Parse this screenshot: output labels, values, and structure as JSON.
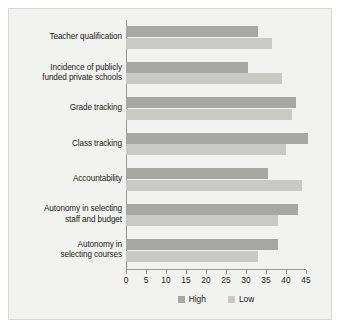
{
  "chart_data": {
    "type": "bar",
    "orientation": "horizontal",
    "title": "",
    "xlabel": "",
    "ylabel": "",
    "xlim": [
      0,
      45
    ],
    "xticks": [
      0,
      5,
      10,
      15,
      20,
      25,
      30,
      35,
      40,
      45
    ],
    "grid": false,
    "legend_position": "bottom-center",
    "categories": [
      "Teacher qualification",
      "Incidence of publicly funded private schools",
      "Grade tracking",
      "Class tracking",
      "Accountability",
      "Autonomy in selecting staff and budget",
      "Autonomy in selecting courses"
    ],
    "category_lines": [
      [
        "Teacher qualification"
      ],
      [
        "Incidence of publicly",
        "funded private schools"
      ],
      [
        "Grade tracking"
      ],
      [
        "Class tracking"
      ],
      [
        "Accountability"
      ],
      [
        "Autonomy in selecting",
        "staff and budget"
      ],
      [
        "Autonomy in",
        "selecting courses"
      ]
    ],
    "series": [
      {
        "name": "High",
        "color": "#a7a7a4",
        "values": [
          33,
          30.5,
          42.5,
          45.5,
          35.5,
          43,
          38
        ]
      },
      {
        "name": "Low",
        "color": "#c9c9c6",
        "values": [
          36.5,
          39,
          41.5,
          40,
          44,
          38,
          33
        ]
      }
    ]
  },
  "legend": {
    "items": [
      {
        "label": "High",
        "swatch": "high"
      },
      {
        "label": "Low",
        "swatch": "low"
      }
    ]
  }
}
